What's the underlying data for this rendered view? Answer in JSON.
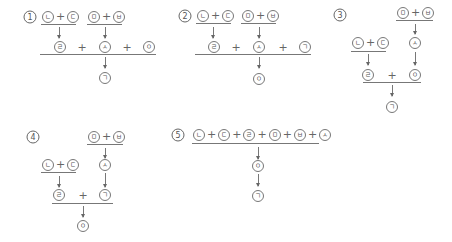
{
  "panels": [
    {
      "label": "1",
      "top_left": [
        "ㄴ",
        "ㄷ"
      ],
      "top_right": [
        "ㅁ",
        "ㅂ"
      ],
      "middle": [
        "ㄹ",
        "ㅅ",
        "ㅇ"
      ],
      "result": "ㄱ"
    },
    {
      "label": "2",
      "top_left": [
        "ㄴ",
        "ㄷ"
      ],
      "top_right": [
        "ㅁ",
        "ㅂ"
      ],
      "middle": [
        "ㄹ",
        "ㅅ",
        "ㄱ"
      ],
      "result": "ㅇ"
    },
    {
      "label": "3",
      "top": [
        "ㅁ",
        "ㅂ"
      ],
      "step1": "ㅅ",
      "left": [
        "ㄴ",
        "ㄷ"
      ],
      "step2_left": "ㄹ",
      "step2_right": "ㅇ",
      "result": "ㄱ"
    },
    {
      "label": "4",
      "top": [
        "ㅁ",
        "ㅂ"
      ],
      "step1": "ㅅ",
      "left": [
        "ㄴ",
        "ㄷ"
      ],
      "step2_left": "ㄹ",
      "step2_right": "ㄱ",
      "result": "ㅇ"
    },
    {
      "label": "5",
      "sum": [
        "ㄴ",
        "ㄷ",
        "ㄹ",
        "ㅁ",
        "ㅂ",
        "ㅅ"
      ],
      "step1": "ㅇ",
      "result": "ㄱ"
    }
  ],
  "plus_sign": "+"
}
